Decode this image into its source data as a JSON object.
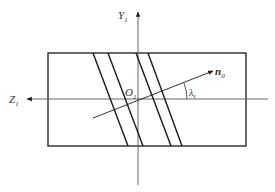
{
  "diagram": {
    "labels": {
      "y_axis": "Y",
      "y_axis_sub": "1",
      "z_axis": "Z",
      "z_axis_sub": "1",
      "origin": "O",
      "origin_sub": "1",
      "normal": "n",
      "normal_sub": "0",
      "angle": "λ",
      "angle_sub": "s"
    },
    "colors": {
      "stroke": "#1a1a1a",
      "axis": "#555555",
      "background": "#ffffff"
    }
  }
}
